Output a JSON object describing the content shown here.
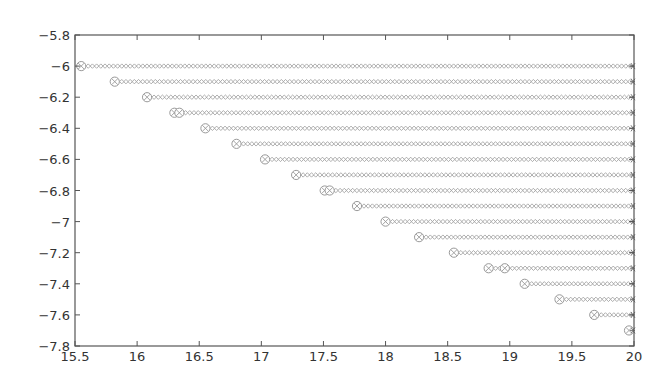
{
  "chart_data": {
    "type": "scatter",
    "title": "",
    "xlabel": "",
    "ylabel": "",
    "xlim": [
      15.5,
      20
    ],
    "ylim": [
      -7.8,
      -5.8
    ],
    "grid": false,
    "legend": null,
    "x_ticks": [
      "15.5",
      "16",
      "16.5",
      "17",
      "17.5",
      "18",
      "18.5",
      "19",
      "19.5",
      "20"
    ],
    "y_ticks": [
      "-5.8",
      "-6",
      "-6.2",
      "-6.4",
      "-6.6",
      "-6.8",
      "-7",
      "-7.2",
      "-7.4",
      "-7.6",
      "-7.8"
    ],
    "marker_style": {
      "start": "circle with x",
      "trail": "small diamond/circle chain",
      "end": "asterisk at x=20"
    },
    "rows": [
      {
        "y": -6.0,
        "x_start": [
          15.55
        ],
        "x_end": 20
      },
      {
        "y": -6.1,
        "x_start": [
          15.82
        ],
        "x_end": 20
      },
      {
        "y": -6.2,
        "x_start": [
          16.08
        ],
        "x_end": 20
      },
      {
        "y": -6.3,
        "x_start": [
          16.3,
          16.34
        ],
        "x_end": 20
      },
      {
        "y": -6.4,
        "x_start": [
          16.55
        ],
        "x_end": 20
      },
      {
        "y": -6.5,
        "x_start": [
          16.8
        ],
        "x_end": 20
      },
      {
        "y": -6.6,
        "x_start": [
          17.03
        ],
        "x_end": 20
      },
      {
        "y": -6.7,
        "x_start": [
          17.28
        ],
        "x_end": 20
      },
      {
        "y": -6.8,
        "x_start": [
          17.51,
          17.55
        ],
        "x_end": 20
      },
      {
        "y": -6.9,
        "x_start": [
          17.77
        ],
        "x_end": 20
      },
      {
        "y": -7.0,
        "x_start": [
          18.0
        ],
        "x_end": 20
      },
      {
        "y": -7.1,
        "x_start": [
          18.27
        ],
        "x_end": 20
      },
      {
        "y": -7.2,
        "x_start": [
          18.55
        ],
        "x_end": 20
      },
      {
        "y": -7.3,
        "x_start": [
          18.83,
          18.96
        ],
        "x_end": 20
      },
      {
        "y": -7.4,
        "x_start": [
          19.12
        ],
        "x_end": 20
      },
      {
        "y": -7.5,
        "x_start": [
          19.4
        ],
        "x_end": 20
      },
      {
        "y": -7.6,
        "x_start": [
          19.68
        ],
        "x_end": 20
      },
      {
        "y": -7.7,
        "x_start": [
          19.96
        ],
        "x_end": 20
      }
    ],
    "colors": {
      "axis": "#555555",
      "marker": "#999999",
      "text": "#333333"
    }
  }
}
